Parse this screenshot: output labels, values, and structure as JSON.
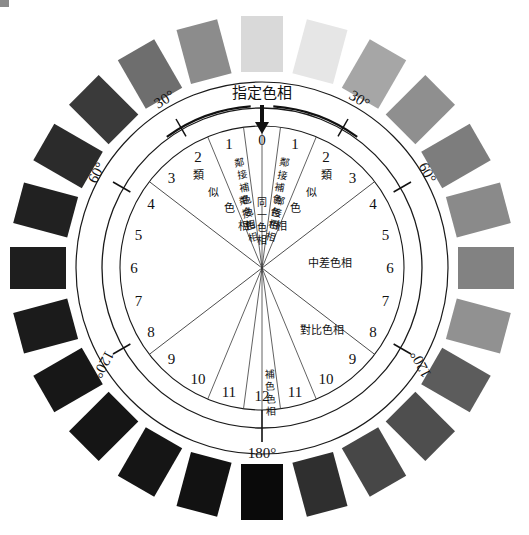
{
  "figure": {
    "kind": "color-hue-relationship-wheel",
    "background": "#ffffff",
    "center": {
      "x": 262,
      "y": 268
    },
    "radii": {
      "swatch_inner": 196,
      "swatch_outer": 252,
      "band_outer": 186,
      "scale_ring": 160,
      "inner_circle": 142
    },
    "title_label": "指定色相",
    "arrow_label_icon": "down-arrow-icon"
  },
  "degree_marks": [
    {
      "label": "30°",
      "value": 30,
      "side": "left"
    },
    {
      "label": "30°",
      "value": 30,
      "side": "right"
    },
    {
      "label": "60°",
      "value": 60,
      "side": "left"
    },
    {
      "label": "60°",
      "value": 60,
      "side": "right"
    },
    {
      "label": "120°",
      "value": 120,
      "side": "left"
    },
    {
      "label": "120°",
      "value": 120,
      "side": "right"
    },
    {
      "label": "180°",
      "value": 180,
      "side": "bottom"
    }
  ],
  "hue_steps": {
    "top": "0",
    "bottom": "12",
    "right": [
      "1",
      "2",
      "3",
      "4",
      "5",
      "6",
      "7",
      "8",
      "9",
      "10",
      "11"
    ],
    "left": [
      "1",
      "2",
      "3",
      "4",
      "5",
      "6",
      "7",
      "8",
      "9",
      "10",
      "11"
    ]
  },
  "sector_labels": [
    {
      "id": "identical-hue",
      "text": "同一色相",
      "orientation": "vertical",
      "side": "center"
    },
    {
      "id": "adjacent-hue-right",
      "text": "鄰接色相",
      "orientation": "vertical",
      "side": "right"
    },
    {
      "id": "adjacent-hue-left",
      "text": "鄰接色相",
      "orientation": "vertical",
      "side": "left"
    },
    {
      "id": "similar-hue-right",
      "text": "類似色相",
      "orientation": "diagonal",
      "side": "right"
    },
    {
      "id": "similar-hue-left",
      "text": "類似色相",
      "orientation": "diagonal",
      "side": "left"
    },
    {
      "id": "medium-hue-right",
      "text": "中差色相",
      "orientation": "horizontal",
      "side": "right"
    },
    {
      "id": "contrast-hue-right",
      "text": "對比色相",
      "orientation": "horizontal",
      "side": "right"
    },
    {
      "id": "adjacent-complement-right",
      "text": "鄰接補色色相",
      "orientation": "vertical",
      "side": "right"
    },
    {
      "id": "adjacent-complement-left",
      "text": "鄰接補色色相",
      "orientation": "vertical",
      "side": "left"
    },
    {
      "id": "complement-hue",
      "text": "補色色相",
      "orientation": "vertical",
      "side": "center-bottom"
    }
  ],
  "chart_data": {
    "type": "pie",
    "title": "指定色相",
    "categories": [
      "0",
      "1",
      "2",
      "3",
      "4",
      "5",
      "6",
      "7",
      "8",
      "9",
      "10",
      "11",
      "12",
      "11",
      "10",
      "9",
      "8",
      "7",
      "6",
      "5",
      "4",
      "3",
      "2",
      "1"
    ],
    "values": [
      15,
      15,
      15,
      15,
      15,
      15,
      15,
      15,
      15,
      15,
      15,
      15,
      15,
      15,
      15,
      15,
      15,
      15,
      15,
      15,
      15,
      15,
      15,
      15
    ],
    "xlabel": "",
    "ylabel": "",
    "legend_position": "none",
    "grid": false,
    "swatches": [
      {
        "index": 0,
        "step": "0",
        "angle_deg": 0,
        "color": "#d9d9d9"
      },
      {
        "index": 1,
        "step": "1",
        "angle_deg": 15,
        "color": "#e6e6e6"
      },
      {
        "index": 2,
        "step": "2",
        "angle_deg": 30,
        "color": "#a6a6a6"
      },
      {
        "index": 3,
        "step": "3",
        "angle_deg": 45,
        "color": "#8f8f8f"
      },
      {
        "index": 4,
        "step": "4",
        "angle_deg": 60,
        "color": "#7d7d7d"
      },
      {
        "index": 5,
        "step": "5",
        "angle_deg": 75,
        "color": "#8a8a8a"
      },
      {
        "index": 6,
        "step": "6",
        "angle_deg": 90,
        "color": "#828282"
      },
      {
        "index": 7,
        "step": "7",
        "angle_deg": 105,
        "color": "#919191"
      },
      {
        "index": 8,
        "step": "8",
        "angle_deg": 120,
        "color": "#5c5c5c"
      },
      {
        "index": 9,
        "step": "9",
        "angle_deg": 135,
        "color": "#4e4e4e"
      },
      {
        "index": 10,
        "step": "10",
        "angle_deg": 150,
        "color": "#474747"
      },
      {
        "index": 11,
        "step": "11",
        "angle_deg": 165,
        "color": "#2f2f2f"
      },
      {
        "index": 12,
        "step": "12",
        "angle_deg": 180,
        "color": "#0a0a0a"
      },
      {
        "index": 13,
        "step": "11",
        "angle_deg": 195,
        "color": "#121212"
      },
      {
        "index": 14,
        "step": "10",
        "angle_deg": 210,
        "color": "#151515"
      },
      {
        "index": 15,
        "step": "9",
        "angle_deg": 225,
        "color": "#151515"
      },
      {
        "index": 16,
        "step": "8",
        "angle_deg": 240,
        "color": "#171717"
      },
      {
        "index": 17,
        "step": "7",
        "angle_deg": 255,
        "color": "#1b1b1b"
      },
      {
        "index": 18,
        "step": "6",
        "angle_deg": 270,
        "color": "#1e1e1e"
      },
      {
        "index": 19,
        "step": "5",
        "angle_deg": 285,
        "color": "#212121"
      },
      {
        "index": 20,
        "step": "4",
        "angle_deg": 300,
        "color": "#2b2b2b"
      },
      {
        "index": 21,
        "step": "3",
        "angle_deg": 315,
        "color": "#3a3a3a"
      },
      {
        "index": 22,
        "step": "2",
        "angle_deg": 330,
        "color": "#6e6e6e"
      },
      {
        "index": 23,
        "step": "1",
        "angle_deg": 345,
        "color": "#8c8c8c"
      }
    ]
  }
}
